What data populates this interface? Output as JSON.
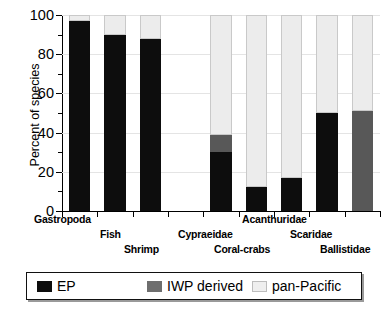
{
  "chart_data": {
    "type": "bar",
    "subtype": "stacked-percent",
    "title": "",
    "xlabel": "",
    "ylabel": "Percent of species",
    "ylim": [
      0,
      100
    ],
    "yticks": [
      0,
      20,
      40,
      60,
      80,
      100
    ],
    "ytick_labels": [
      "0",
      "20",
      "40",
      "60",
      "80",
      "100"
    ],
    "yminor_ticks": [
      10,
      30,
      50,
      70,
      90
    ],
    "grid": true,
    "legend_position": "below-plot",
    "legend": [
      {
        "key": "ep",
        "label": "EP",
        "color": "#0d0d0d"
      },
      {
        "key": "iwp",
        "label": "IWP derived",
        "color": "#6e6e6e"
      },
      {
        "key": "pan",
        "label": "pan-Pacific",
        "color": "#efefef"
      }
    ],
    "categories": [
      "Gastropoda",
      "Fish",
      "Shrimp",
      "Cypraeidae",
      "Coral-crabs",
      "Acanthuridae",
      "Scaridae",
      "Ballistidae"
    ],
    "series": [
      {
        "name": "EP",
        "values": [
          97,
          90,
          88,
          30,
          12,
          17,
          50,
          0
        ]
      },
      {
        "name": "IWP derived",
        "values": [
          0,
          0,
          0,
          9,
          0,
          0,
          0,
          51
        ]
      },
      {
        "name": "pan-Pacific",
        "values": [
          3,
          10,
          12,
          61,
          88,
          83,
          50,
          49
        ]
      }
    ],
    "gap_after_category_index": 2
  },
  "axis": {
    "y_title": "Percent of species"
  },
  "xlabels": [
    {
      "text": "Gastropoda",
      "left": 34,
      "top": 213
    },
    {
      "text": "Fish",
      "left": 100,
      "top": 228
    },
    {
      "text": "Shrimp",
      "left": 124,
      "top": 243
    },
    {
      "text": "Cypraeidae",
      "left": 178,
      "top": 228
    },
    {
      "text": "Coral-crabs",
      "left": 214,
      "top": 243
    },
    {
      "text": "Acanthuridae",
      "left": 242,
      "top": 213
    },
    {
      "text": "Scaridae",
      "left": 290,
      "top": 228
    },
    {
      "text": "Ballistidae",
      "left": 320,
      "top": 243
    }
  ]
}
